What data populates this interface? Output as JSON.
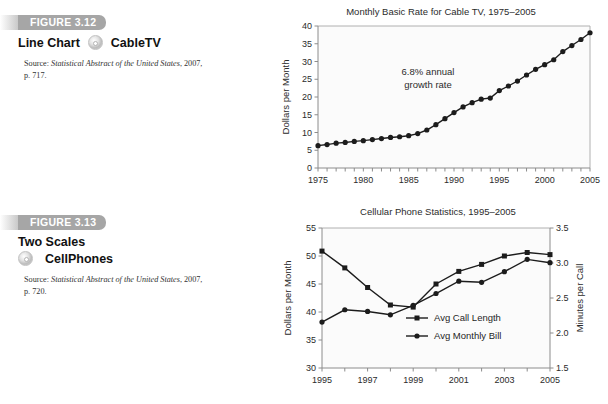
{
  "figures": [
    {
      "tab_label": "FIGURE 3.12",
      "title": "Line Chart",
      "dataset": "CableTV",
      "icon": "disc-icon",
      "source_prefix": "Source: ",
      "source_italic": "Statistical Abstract of the United",
      "source_italic2": "States",
      "source_rest": ", 2007, p. 717."
    },
    {
      "tab_label": "FIGURE 3.13",
      "title": "Two Scales",
      "dataset": "CellPhones",
      "icon": "disc-icon",
      "source_prefix": "Source: ",
      "source_italic": "Statistical Abstract of the United",
      "source_italic2": "States",
      "source_rest": ", 2007, p. 720."
    }
  ],
  "chart_data": [
    {
      "type": "line",
      "title": "Monthly Basic Rate for Cable TV, 1975–2005",
      "xlabel": "",
      "ylabel": "Dollars per Month",
      "xlim": [
        1975,
        2005
      ],
      "ylim": [
        0,
        40
      ],
      "ytick_step": 5,
      "yticks": [
        0,
        5,
        10,
        15,
        20,
        25,
        30,
        35,
        40
      ],
      "xticks_labeled": [
        1975,
        1980,
        1985,
        1990,
        1995,
        2000,
        2005
      ],
      "xtick_step_minor": 1,
      "grid": false,
      "legend": "none",
      "annotation": "6.8% annual\ngrowth rate",
      "annotation_line1": "6.8% annual",
      "annotation_line2": "growth rate",
      "marker": "circle",
      "x": [
        1975,
        1976,
        1977,
        1978,
        1979,
        1980,
        1981,
        1982,
        1983,
        1984,
        1985,
        1986,
        1987,
        1988,
        1989,
        1990,
        1991,
        1992,
        1993,
        1994,
        1995,
        1996,
        1997,
        1998,
        1999,
        2000,
        2001,
        2002,
        2003,
        2004,
        2005
      ],
      "values": [
        6.3,
        6.6,
        7.0,
        7.2,
        7.5,
        7.7,
        8.0,
        8.3,
        8.6,
        8.8,
        9.1,
        9.7,
        10.7,
        12.2,
        13.9,
        15.6,
        17.2,
        18.4,
        19.4,
        19.7,
        21.8,
        23.1,
        24.5,
        26.2,
        27.8,
        29.1,
        30.5,
        32.8,
        34.5,
        36.2,
        38.1,
        40.2
      ],
      "series": [
        {
          "name": "Monthly Basic Rate",
          "values": [
            6.3,
            6.6,
            7.0,
            7.2,
            7.5,
            7.7,
            8.0,
            8.3,
            8.6,
            8.8,
            9.1,
            9.7,
            10.7,
            12.2,
            13.9,
            15.6,
            17.2,
            18.4,
            19.4,
            19.7,
            21.8,
            23.1,
            24.5,
            26.2,
            27.8,
            29.1,
            30.5,
            32.8,
            34.5,
            36.2,
            38.1,
            40.2
          ]
        }
      ]
    },
    {
      "type": "line",
      "title": "Cellular Phone Statistics, 1995–2005",
      "xlabel": "",
      "ylabel_left": "Dollars per Month",
      "ylabel_right": "Minutes per Call",
      "xlim": [
        1995,
        2005
      ],
      "ylim_left": [
        30,
        55
      ],
      "ylim_right": [
        1.5,
        3.5
      ],
      "yticks_left": [
        30,
        35,
        40,
        45,
        50,
        55
      ],
      "yticks_right": [
        "1.5",
        "2.0",
        "2.5",
        "3.0",
        "3.5"
      ],
      "xticks_labeled": [
        1995,
        1997,
        1999,
        2001,
        2003,
        2005
      ],
      "xtick_step_minor": 1,
      "grid": false,
      "legend_position": "center-bottom-inside",
      "x": [
        1995,
        1996,
        1997,
        1998,
        1999,
        2000,
        2001,
        2002,
        2003,
        2004,
        2005
      ],
      "series": [
        {
          "name": "Avg Call Length",
          "axis": "right",
          "marker": "square",
          "values": [
            3.17,
            2.93,
            2.65,
            2.4,
            2.37,
            2.7,
            2.88,
            2.98,
            3.1,
            3.15,
            3.12
          ]
        },
        {
          "name": "Avg Monthly Bill",
          "axis": "left",
          "marker": "circle",
          "values": [
            38.2,
            40.4,
            40.1,
            39.5,
            41.2,
            43.3,
            45.5,
            45.3,
            47.2,
            49.4,
            48.8
          ]
        }
      ],
      "legend_entries": [
        "Avg Call Length",
        "Avg Monthly Bill"
      ]
    }
  ],
  "colors": {
    "tab_bg": "#a6a6a6",
    "line": "#1c1c1c",
    "axis": "#8c8c8c",
    "plot_bg": "#fbfbfb",
    "text": "#1a1a1a"
  }
}
